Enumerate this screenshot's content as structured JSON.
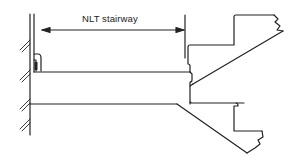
{
  "diagram": {
    "type": "architectural-section",
    "dimension": {
      "label": "NLT stairway",
      "from": "wall handrail",
      "to": "stair nosing line"
    },
    "colors": {
      "stroke": "#222222",
      "background": "#ffffff"
    }
  }
}
